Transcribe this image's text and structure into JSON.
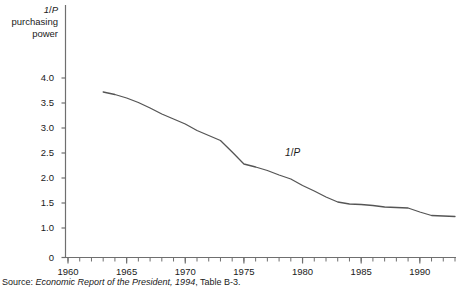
{
  "chart_data": {
    "type": "line",
    "title": "",
    "ylabel": "1/P purchasing power",
    "ylabel_lines": [
      "1/P",
      "purchasing",
      "power"
    ],
    "xlabel": "",
    "xlim": [
      1960,
      1993
    ],
    "ylim": [
      0,
      4.0
    ],
    "grid": false,
    "legend": "none",
    "y_ticks": [
      "0",
      "1.0",
      "1.5",
      "2.0",
      "2.5",
      "3.0",
      "3.5",
      "4.0"
    ],
    "y_tick_values": [
      0,
      1.0,
      1.5,
      2.0,
      2.5,
      3.0,
      3.5,
      4.0
    ],
    "y_axis_break": true,
    "x_ticks": [
      "1960",
      "1965",
      "1970",
      "1975",
      "1980",
      "1985",
      "1990"
    ],
    "x_tick_values": [
      1960,
      1965,
      1970,
      1975,
      1980,
      1985,
      1990
    ],
    "x_minor_tick_interval": 1,
    "series": [
      {
        "name": "1/P",
        "color": "#555555",
        "annotation": "1/P",
        "x": [
          1963,
          1964,
          1965,
          1966,
          1967,
          1968,
          1969,
          1970,
          1971,
          1972,
          1973,
          1974,
          1975,
          1976,
          1977,
          1978,
          1979,
          1980,
          1981,
          1982,
          1983,
          1984,
          1985,
          1986,
          1987,
          1988,
          1989,
          1990,
          1991,
          1992,
          1993
        ],
        "values": [
          3.72,
          3.67,
          3.6,
          3.51,
          3.4,
          3.28,
          3.18,
          3.08,
          2.95,
          2.85,
          2.75,
          2.52,
          2.28,
          2.22,
          2.15,
          2.06,
          1.98,
          1.85,
          1.74,
          1.62,
          1.52,
          1.48,
          1.47,
          1.45,
          1.42,
          1.41,
          1.4,
          1.32,
          1.25,
          1.24,
          1.23
        ]
      }
    ]
  },
  "source": {
    "label": "Source:",
    "title": "Economic Report of the President, 1994",
    "tail": ", Table B-3."
  }
}
